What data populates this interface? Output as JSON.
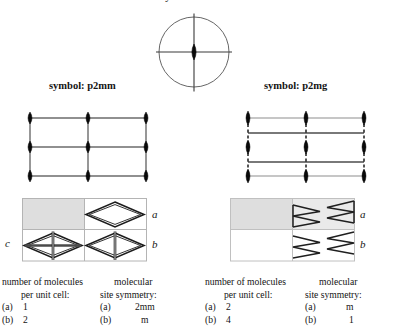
{
  "title": "crystal class: 2mm",
  "top_symbol_diagram": {
    "name": "2mm-point-group-circle",
    "description": "circle with horizontal and vertical mirror lines and central 2-fold rotation lens"
  },
  "left_panel": {
    "symbol_label": "symbol: p2mm",
    "lattice": {
      "type": "p2mm",
      "vertical_line_style": "solid",
      "horizontal_line_style": "solid",
      "nodes_cols": 3,
      "nodes_rows": 3
    },
    "cells": {
      "row_letters": [
        "a",
        "b"
      ],
      "left_letter": "c",
      "top_left_shaded": true,
      "motifs": {
        "top_right": "plain-diamond",
        "bottom_left": "diamond-with-cross",
        "bottom_right": "diamond-with-vertical-line"
      }
    },
    "count_block": {
      "head_line1": "number of molecules",
      "head_line2": "per unit cell:",
      "rows": [
        {
          "tag": "(a)",
          "value": "1"
        },
        {
          "tag": "(b)",
          "value": "2"
        }
      ]
    },
    "site_block": {
      "head_line1": "molecular",
      "head_line2": "site symmetry:",
      "rows": [
        {
          "tag": "(a)",
          "value": "2mm"
        },
        {
          "tag": "(b)",
          "value": "m"
        }
      ]
    }
  },
  "right_panel": {
    "symbol_label": "symbol: p2mg",
    "lattice": {
      "type": "p2mg",
      "vertical_line_style": "dashed",
      "horizontal_line_style": "solid",
      "nodes_cols": 3,
      "nodes_rows": 3
    },
    "cells": {
      "row_letters": [
        "a",
        "b"
      ],
      "top_left_shaded": true,
      "motifs": {
        "top_right": "zigzag-arrow-pair",
        "bottom_right": "zigzag-arrow-pair-mirrored"
      }
    },
    "count_block": {
      "head_line1": "number of molecules",
      "head_line2": "per unit cell:",
      "rows": [
        {
          "tag": "(a)",
          "value": "2"
        },
        {
          "tag": "(b)",
          "value": "4"
        }
      ]
    },
    "site_block": {
      "head_line1": "molecular",
      "head_line2": "site symmetry:",
      "rows": [
        {
          "tag": "(a)",
          "value": "m"
        },
        {
          "tag": "(b)",
          "value": "1"
        }
      ]
    }
  },
  "colors": {
    "ink": "#111111",
    "line": "#4a4a4a",
    "node": "#0a0a0a",
    "shade": "#dcdcdc",
    "cell_border": "#b4b4b4"
  }
}
